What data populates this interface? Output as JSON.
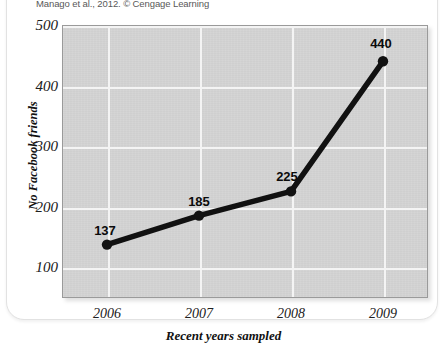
{
  "credit": {
    "text": "Manago et al., 2012. © Cengage Learning"
  },
  "chart_data": {
    "type": "line",
    "title": "",
    "subtitle": "",
    "xlabel": "Recent years sampled",
    "ylabel": "No Facebook friends",
    "categories": [
      "2006",
      "2007",
      "2008",
      "2009"
    ],
    "x": [
      2006,
      2007,
      2008,
      2009
    ],
    "values": [
      137,
      185,
      225,
      440
    ],
    "point_labels": [
      "137",
      "185",
      "225",
      "440"
    ],
    "series": [
      {
        "name": "No Facebook friends",
        "values": [
          137,
          185,
          225,
          440
        ]
      }
    ],
    "ylim": [
      50,
      500
    ],
    "yticks": [
      100,
      200,
      300,
      400,
      500
    ],
    "ytick_labels": [
      "100",
      "200",
      "300",
      "400",
      "500"
    ],
    "xticks": [
      2006,
      2007,
      2008,
      2009
    ],
    "xtick_labels": [
      "2006",
      "2007",
      "2008",
      "2009"
    ],
    "grid": true,
    "grid_color": "#f4f4f4",
    "plot_background": "#d3d3d3",
    "line_color": "#111111",
    "marker_color": "#111111",
    "legend": null,
    "legend_position": "none"
  }
}
